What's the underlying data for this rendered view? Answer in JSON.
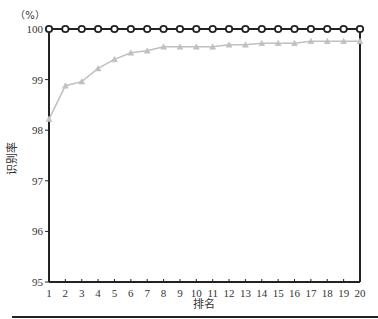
{
  "chart_data": {
    "type": "line",
    "title": "",
    "xlabel": "排名",
    "ylabel": "识别率",
    "y_unit": "（%）",
    "xlim": [
      1,
      20
    ],
    "ylim": [
      95,
      100
    ],
    "grid": false,
    "legend": null,
    "x": [
      1,
      2,
      3,
      4,
      5,
      6,
      7,
      8,
      9,
      10,
      11,
      12,
      13,
      14,
      15,
      16,
      17,
      18,
      19,
      20
    ],
    "x_tick_labels": [
      "1",
      "2",
      "3",
      "4",
      "5",
      "6",
      "7",
      "8",
      "9",
      "10",
      "11",
      "12",
      "13",
      "14",
      "15",
      "16",
      "17",
      "18",
      "19",
      "20"
    ],
    "y_tick_labels": [
      "95",
      "96",
      "97",
      "98",
      "99",
      "100"
    ],
    "series": [
      {
        "name": "series-black-diamond",
        "color": "#222222",
        "marker": "diamond",
        "values": [
          100,
          100,
          100,
          100,
          100,
          100,
          100,
          100,
          100,
          100,
          100,
          100,
          100,
          100,
          100,
          100,
          100,
          100,
          100,
          100
        ]
      },
      {
        "name": "series-gray-triangle",
        "color": "#c0c0c0",
        "marker": "triangle",
        "values": [
          98.22,
          98.88,
          98.96,
          99.22,
          99.4,
          99.53,
          99.57,
          99.65,
          99.65,
          99.65,
          99.65,
          99.69,
          99.69,
          99.72,
          99.72,
          99.72,
          99.76,
          99.76,
          99.76,
          99.76
        ]
      }
    ]
  }
}
